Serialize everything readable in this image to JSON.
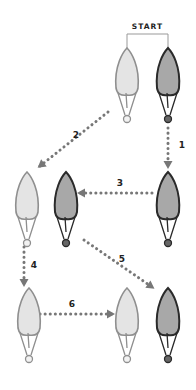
{
  "title": "START",
  "colors": {
    "light_fill": "#e4e4e4",
    "light_stroke": "#8f8f8f",
    "dark_fill": "#a8a8a8",
    "dark_stroke": "#2a2a2a",
    "arrow": "#777777",
    "text": "#222222",
    "bracket": "#999999"
  },
  "bulbs": [
    {
      "id": "start-light",
      "variant": "light",
      "x": 127,
      "y": 48
    },
    {
      "id": "start-dark",
      "variant": "dark",
      "x": 168,
      "y": 48
    },
    {
      "id": "step1-dark",
      "variant": "dark",
      "x": 168,
      "y": 172
    },
    {
      "id": "step2-light",
      "variant": "light",
      "x": 27,
      "y": 172
    },
    {
      "id": "step3-dark",
      "variant": "dark",
      "x": 66,
      "y": 172
    },
    {
      "id": "step4-light",
      "variant": "light",
      "x": 29,
      "y": 288
    },
    {
      "id": "step6-light",
      "variant": "light",
      "x": 127,
      "y": 288
    },
    {
      "id": "step5-dark",
      "variant": "dark",
      "x": 168,
      "y": 288
    }
  ],
  "arrows": [
    {
      "label": "1",
      "from": [
        168,
        128
      ],
      "to": [
        168,
        166
      ],
      "label_pos": [
        182,
        148
      ]
    },
    {
      "label": "2",
      "from": [
        108,
        112
      ],
      "to": [
        40,
        166
      ],
      "label_pos": [
        76,
        138
      ]
    },
    {
      "label": "3",
      "from": [
        152,
        193
      ],
      "to": [
        80,
        193
      ],
      "label_pos": [
        120,
        186
      ]
    },
    {
      "label": "4",
      "from": [
        24,
        247
      ],
      "to": [
        24,
        284
      ],
      "label_pos": [
        34,
        268
      ]
    },
    {
      "label": "5",
      "from": [
        84,
        240
      ],
      "to": [
        152,
        287
      ],
      "label_pos": [
        122,
        262
      ]
    },
    {
      "label": "6",
      "from": [
        40,
        314
      ],
      "to": [
        112,
        314
      ],
      "label_pos": [
        72,
        307
      ]
    }
  ]
}
